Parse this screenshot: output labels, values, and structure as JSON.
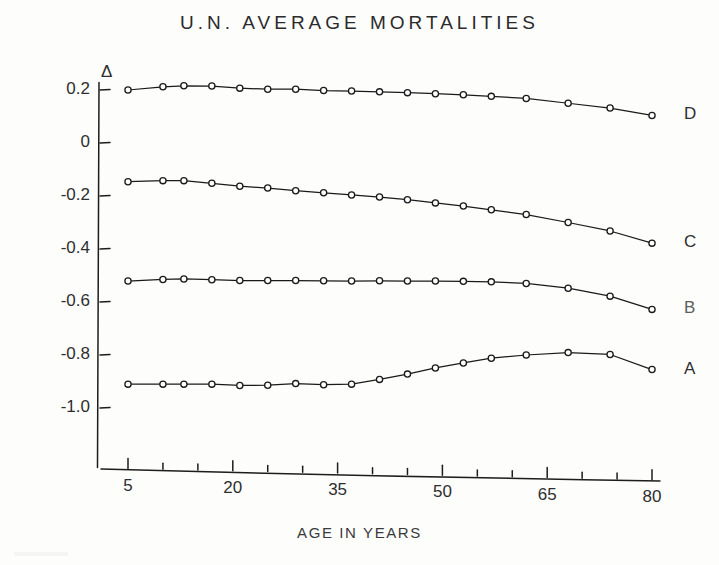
{
  "chart": {
    "title": "U.N. AVERAGE MORTALITIES",
    "xlabel": "AGE IN YEARS",
    "ylabel_symbol": "Δ"
  },
  "axes": {
    "y_tick_labels": [
      "0.2",
      "0",
      "-0.2",
      "-0.4",
      "-0.6",
      "-0.8",
      "-1.0"
    ],
    "x_tick_labels": [
      "5",
      "20",
      "35",
      "50",
      "65",
      "80"
    ]
  },
  "series_labels": {
    "d": "D",
    "c": "C",
    "b": "B",
    "a": "A"
  },
  "chart_data": {
    "type": "line",
    "title": "U.N. AVERAGE MORTALITIES",
    "xlabel": "AGE IN YEARS",
    "ylabel": "Δ",
    "xlim": [
      0,
      82
    ],
    "ylim": [
      -1.12,
      0.26
    ],
    "grid": false,
    "legend": "right-of-plot (inline curve labels)",
    "x_ticks_major": [
      5,
      20,
      35,
      50,
      65,
      80
    ],
    "x_ticks_minor": [
      10,
      15,
      25,
      30,
      40,
      45,
      55,
      60,
      70,
      75
    ],
    "y_ticks": [
      0.2,
      0,
      -0.2,
      -0.4,
      -0.6,
      -0.8,
      -1.0
    ],
    "marker": "open-circle",
    "series": [
      {
        "name": "D",
        "label": "D",
        "x": [
          5,
          10,
          13,
          17,
          21,
          25,
          29,
          33,
          37,
          41,
          45,
          49,
          53,
          57,
          62,
          68,
          74,
          80
        ],
        "y": [
          0.2,
          0.212,
          0.216,
          0.215,
          0.207,
          0.203,
          0.203,
          0.198,
          0.196,
          0.193,
          0.19,
          0.186,
          0.182,
          0.176,
          0.168,
          0.15,
          0.132,
          0.104
        ]
      },
      {
        "name": "C",
        "label": "C",
        "x": [
          5,
          10,
          13,
          17,
          21,
          25,
          29,
          33,
          37,
          41,
          45,
          49,
          53,
          57,
          62,
          68,
          74,
          80
        ],
        "y": [
          -0.146,
          -0.142,
          -0.142,
          -0.152,
          -0.163,
          -0.17,
          -0.18,
          -0.188,
          -0.196,
          -0.204,
          -0.214,
          -0.226,
          -0.238,
          -0.252,
          -0.27,
          -0.3,
          -0.332,
          -0.378
        ]
      },
      {
        "name": "B",
        "label": "B",
        "x": [
          5,
          10,
          13,
          17,
          21,
          25,
          29,
          33,
          37,
          41,
          45,
          49,
          53,
          57,
          62,
          68,
          74,
          80
        ],
        "y": [
          -0.521,
          -0.515,
          -0.513,
          -0.516,
          -0.519,
          -0.519,
          -0.519,
          -0.52,
          -0.521,
          -0.52,
          -0.521,
          -0.521,
          -0.522,
          -0.524,
          -0.53,
          -0.548,
          -0.578,
          -0.628
        ]
      },
      {
        "name": "A",
        "label": "A",
        "x": [
          5,
          10,
          13,
          17,
          21,
          25,
          29,
          33,
          37,
          41,
          45,
          49,
          53,
          57,
          62,
          68,
          74,
          80
        ],
        "y": [
          -0.91,
          -0.91,
          -0.91,
          -0.91,
          -0.915,
          -0.914,
          -0.908,
          -0.912,
          -0.91,
          -0.892,
          -0.872,
          -0.849,
          -0.83,
          -0.812,
          -0.8,
          -0.791,
          -0.798,
          -0.855
        ]
      }
    ]
  }
}
